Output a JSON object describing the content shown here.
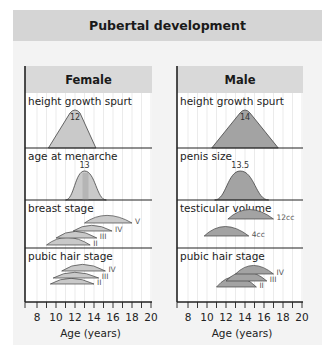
{
  "title": "Pubertal development",
  "colors": {
    "panel_bg": "#f3f3f3",
    "title_bg": "#d5d5d5",
    "header_bg": "#d9d9d9",
    "female_fill": "#c9c9c9",
    "male_fill": "#a3a3a3",
    "axis": "#222222",
    "grid": "#e2e2e2"
  },
  "chart_data": [
    {
      "type": "area",
      "title": "Female",
      "xlabel": "Age (years)",
      "xlim": [
        7,
        20
      ],
      "xticks": [
        8,
        10,
        12,
        14,
        16,
        18,
        20
      ],
      "grid": true,
      "panels": [
        {
          "label": "height growth spurt",
          "shape": "triangle",
          "start": 9.2,
          "peak": 12,
          "end": 14.2,
          "annotation": "12"
        },
        {
          "label": "age at menarche",
          "shape": "bell",
          "start": 11,
          "peak": 13,
          "end": 15.3,
          "annotation": "13"
        },
        {
          "label": "breast stage",
          "shape": "arcs",
          "series": [
            {
              "name": "II",
              "start": 9,
              "end": 13.6
            },
            {
              "name": "III",
              "start": 10,
              "end": 14.3
            },
            {
              "name": "IV",
              "start": 11.8,
              "end": 15.9
            },
            {
              "name": "V",
              "start": 13,
              "end": 18
            }
          ]
        },
        {
          "label": "pubic hair stage",
          "shape": "arcs",
          "series": [
            {
              "name": "II",
              "start": 9.4,
              "end": 14
            },
            {
              "name": "III",
              "start": 9.7,
              "end": 14.5
            },
            {
              "name": "IV",
              "start": 10.6,
              "end": 15.2
            }
          ]
        }
      ]
    },
    {
      "type": "area",
      "title": "Male",
      "xlabel": "Age (years)",
      "xlim": [
        7,
        20
      ],
      "xticks": [
        8,
        10,
        12,
        14,
        16,
        18,
        20
      ],
      "grid": true,
      "panels": [
        {
          "label": "height growth spurt",
          "shape": "triangle",
          "start": 10.5,
          "peak": 14,
          "end": 17.5,
          "annotation": "14"
        },
        {
          "label": "penis size",
          "shape": "bell",
          "start": 10.8,
          "peak": 13.5,
          "end": 16.5,
          "annotation": "13.5"
        },
        {
          "label": "testicular volume",
          "shape": "arcs",
          "series": [
            {
              "name": "4cc",
              "start": 9.7,
              "end": 14.4
            },
            {
              "name": "12cc",
              "start": 12.2,
              "end": 17
            }
          ]
        },
        {
          "label": "pubic hair stage",
          "shape": "arcs",
          "series": [
            {
              "name": "II",
              "start": 11,
              "end": 15.2
            },
            {
              "name": "III",
              "start": 12,
              "end": 16.3
            },
            {
              "name": "IV",
              "start": 13,
              "end": 17
            }
          ]
        }
      ]
    }
  ]
}
